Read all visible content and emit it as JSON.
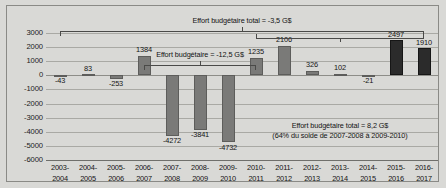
{
  "chart_data": {
    "type": "bar",
    "title": "",
    "xlabel": "",
    "ylabel": "",
    "grid": true,
    "legend": "none",
    "ylim": [
      -6000,
      3000
    ],
    "ystep": 1000,
    "ytick_labels": [
      "3000",
      "2000",
      "1000",
      "0",
      "-1000",
      "-2000",
      "-3000",
      "-4000",
      "-5000",
      "-6000"
    ],
    "categories": [
      "2003-\n2004",
      "2004-\n2005",
      "2005-\n2006",
      "2006-\n2007",
      "2007-\n2008",
      "2008-\n2009",
      "2009-\n2010",
      "2010-\n2011",
      "2011-\n2012",
      "2012-\n2013",
      "2013-\n2014",
      "2014-\n2015",
      "2015-\n2016",
      "2016-\n2017"
    ],
    "bars": [
      {
        "cat_line1": "2003-",
        "cat_line2": "2004",
        "value": -43,
        "label": "-43",
        "color": "#7a7a78",
        "style": "grey"
      },
      {
        "cat_line1": "2004-",
        "cat_line2": "2005",
        "value": 83,
        "label": "83",
        "color": "#7a7a78",
        "style": "grey"
      },
      {
        "cat_line1": "2005-",
        "cat_line2": "2006",
        "value": -253,
        "label": "-253",
        "color": "#7a7a78",
        "style": "grey"
      },
      {
        "cat_line1": "2006-",
        "cat_line2": "2007",
        "value": 1384,
        "label": "1384",
        "color": "#7a7a78",
        "style": "grey"
      },
      {
        "cat_line1": "2007-",
        "cat_line2": "2008",
        "value": -4272,
        "label": "-4272",
        "color": "#7a7a78",
        "style": "grey"
      },
      {
        "cat_line1": "2008-",
        "cat_line2": "2009",
        "value": -3841,
        "label": "-3841",
        "color": "#7a7a78",
        "style": "grey"
      },
      {
        "cat_line1": "2009-",
        "cat_line2": "2010",
        "value": -4732,
        "label": "-4732",
        "color": "#7a7a78",
        "style": "grey"
      },
      {
        "cat_line1": "2010-",
        "cat_line2": "2011",
        "value": 1235,
        "label": "1235",
        "color": "#7a7a78",
        "style": "grey"
      },
      {
        "cat_line1": "2011-",
        "cat_line2": "2012",
        "value": 2106,
        "label": "2106",
        "color": "#7a7a78",
        "style": "grey"
      },
      {
        "cat_line1": "2012-",
        "cat_line2": "2013",
        "value": 326,
        "label": "326",
        "color": "#7a7a78",
        "style": "grey"
      },
      {
        "cat_line1": "2013-",
        "cat_line2": "2014",
        "value": 102,
        "label": "102",
        "color": "#7a7a78",
        "style": "grey"
      },
      {
        "cat_line1": "2014-",
        "cat_line2": "2015",
        "value": -21,
        "label": "-21",
        "color": "#7a7a78",
        "style": "grey"
      },
      {
        "cat_line1": "2015-",
        "cat_line2": "2016",
        "value": 2497,
        "label": "2497",
        "color": "#2b2b2b",
        "style": "dark"
      },
      {
        "cat_line1": "2016-",
        "cat_line2": "2017",
        "value": 1910,
        "label": "1910",
        "color": "#2b2b2b",
        "style": "dark"
      }
    ],
    "annotations": [
      {
        "id": "total-overall",
        "text": "Effort budgétaire total = -3,5 G$",
        "span_from": "2003-2004",
        "span_to": "2016-2017"
      },
      {
        "id": "effort-deficit",
        "text": "Effort budgétaire = -12,5 G$",
        "span_from": "2006-2007",
        "span_to": "2010-2011"
      },
      {
        "id": "total-surplus",
        "text": "Effort budgétaire total = 8,2 G$",
        "subtext": "(64% du solde de 2007-2008 à 2009-2010)",
        "span_from": "2010-2011",
        "span_to": "2016-2017"
      }
    ]
  }
}
